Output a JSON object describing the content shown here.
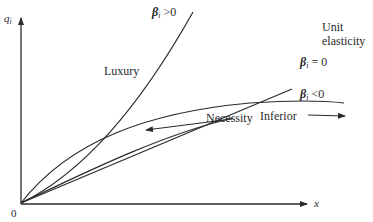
{
  "diagram": {
    "axes": {
      "y_label": "q",
      "y_label_sub": "i",
      "x_label": "x",
      "origin_label": "0"
    },
    "curves": [
      {
        "id": "luxury",
        "name": "Luxury",
        "condition_symbol": "β",
        "condition_sub": "i",
        "condition_rest": " >0"
      },
      {
        "id": "unit",
        "name_line1": "Unit",
        "name_line2": "elasticity",
        "condition_symbol": "β",
        "condition_sub": "i",
        "condition_rest": " = 0"
      },
      {
        "id": "inferior",
        "name": "Inferior",
        "condition_symbol": "β",
        "condition_sub": "i",
        "condition_rest": " <0"
      },
      {
        "id": "necessity",
        "name": "Necessity"
      }
    ],
    "colors": {
      "ink": "#2a2a2a",
      "background": "#ffffff"
    }
  }
}
